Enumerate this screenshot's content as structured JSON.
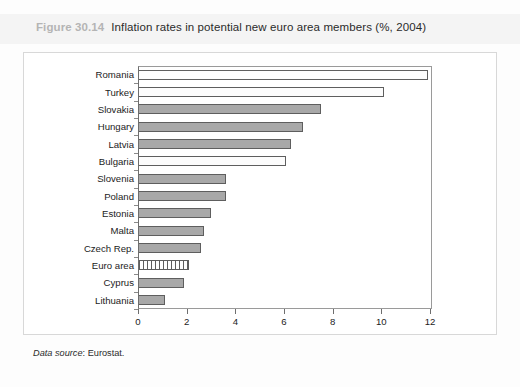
{
  "figure": {
    "number": "Figure 30.14",
    "caption": "Inflation rates in potential new euro area members (%, 2004)",
    "source_label": "Data source",
    "source_value": ": Eurostat."
  },
  "chart_data": {
    "type": "bar",
    "orientation": "horizontal",
    "title": "Inflation rates in potential new euro area members (%, 2004)",
    "xlabel": "",
    "ylabel": "",
    "xlim": [
      0,
      12
    ],
    "xticks": [
      0,
      2,
      4,
      6,
      8,
      10,
      12
    ],
    "xtick_labels": [
      "0",
      "2",
      "4",
      "6",
      "8",
      "10",
      "12"
    ],
    "grid": false,
    "legend": null,
    "categories": [
      "Romania",
      "Turkey",
      "Slovakia",
      "Hungary",
      "Latvia",
      "Bulgaria",
      "Slovenia",
      "Poland",
      "Estonia",
      "Malta",
      "Czech Rep.",
      "Euro area",
      "Cyprus",
      "Lithuania"
    ],
    "values": [
      11.9,
      10.1,
      7.5,
      6.8,
      6.3,
      6.1,
      3.6,
      3.6,
      3.0,
      2.7,
      2.6,
      2.1,
      1.9,
      1.1
    ],
    "bar_styles": [
      "open",
      "open",
      "solid",
      "solid",
      "solid",
      "open",
      "solid",
      "solid",
      "solid",
      "solid",
      "solid",
      "hatch",
      "solid",
      "solid"
    ],
    "colors": {
      "bar_fill": "#a8a8a8",
      "bar_open_fill": "#fcfcfc",
      "bar_border": "#5e5e5e",
      "axis": "#6e6e6e",
      "text": "#1c1c1c",
      "figure_number": "#b4b4b4",
      "title_band": "#f4f4f4"
    }
  }
}
